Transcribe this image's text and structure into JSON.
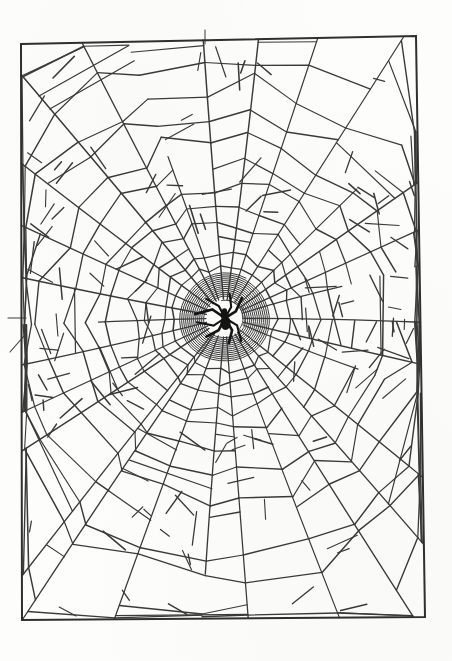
{
  "figure": {
    "title": "Spider Web",
    "medium": "ink line drawing",
    "background_color": "#fdfdfc",
    "line_color": "#3a3a3a",
    "frame_color": "#2f2f2f",
    "spider_color": "#1a1a1a"
  },
  "canvas": {
    "width": 452,
    "height": 661
  },
  "frame": {
    "label": "border-rectangle",
    "corners": {
      "top_left": [
        21,
        44
      ],
      "top_right": [
        416,
        36
      ],
      "bottom_right": [
        425,
        617
      ],
      "bottom_left": [
        22,
        620
      ]
    },
    "stroke_width": 2.0
  },
  "web": {
    "hub": {
      "center_x": 225,
      "center_y": 318,
      "free_zone_radius": 19,
      "hub_spiral_inner_radius": 20,
      "hub_spiral_outer_radius": 46,
      "hub_spiral_turns": 13
    },
    "radial_count": 30,
    "radial_angle_jitter_deg": 4,
    "spiral_ring_count": 14,
    "spiral_ring_radii": [
      52,
      64,
      78,
      94,
      112,
      133,
      156,
      181,
      208,
      237,
      268,
      301,
      336,
      372
    ],
    "stub_count": 120,
    "stub_length_min": 10,
    "stub_length_max": 34
  },
  "spider": {
    "label": "spider",
    "center_x": 225,
    "center_y": 318,
    "body_length": 17,
    "body_width": 9,
    "leg_count": 8,
    "leg_span": 31,
    "color": "#141414"
  }
}
